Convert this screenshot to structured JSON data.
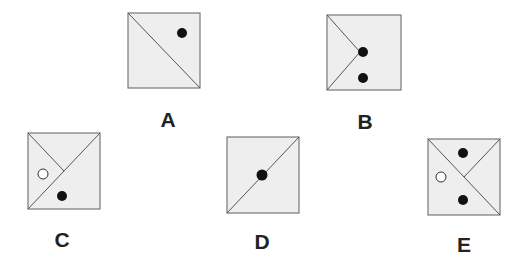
{
  "colors": {
    "square_fill": "#eeeeee",
    "square_stroke": "#777777",
    "line_stroke": "#555555",
    "dot_black": "#111111",
    "dot_white": "#ffffff",
    "label": "#222222"
  },
  "options": [
    {
      "id": "A",
      "label": "A",
      "description": "Diagonal from top-left to bottom-right; one black dot in upper-right triangle"
    },
    {
      "id": "B",
      "label": "B",
      "description": "Lines from top-left and bottom-left meeting at center; two black dots stacked vertically on right"
    },
    {
      "id": "C",
      "label": "C",
      "description": "Diagonal from bottom-left to top-right plus half-diagonal from top-left to center; white dot in left region, black dot in lower region"
    },
    {
      "id": "D",
      "label": "D",
      "description": "Diagonal from bottom-left to top-right; one black dot at center on the line"
    },
    {
      "id": "E",
      "label": "E",
      "description": "Diagonal from top-left to bottom-right plus half-diagonal from top-right to center; black dot top, white dot left, black dot bottom"
    }
  ]
}
